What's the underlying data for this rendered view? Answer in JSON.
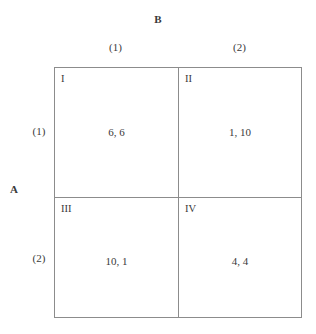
{
  "figure": {
    "type": "payoff-matrix",
    "row_player": "A",
    "column_player": "B",
    "row_strategies": [
      "(1)",
      "(2)"
    ],
    "column_strategies": [
      "(1)",
      "(2)"
    ],
    "border_color": "#8c8c8c",
    "text_color": "#3a3a3a",
    "background": "#ffffff"
  },
  "cells": [
    {
      "id": "I",
      "payoff": "6, 6",
      "row": "(1)",
      "col": "(1)",
      "row_payoff": 6,
      "col_payoff": 6
    },
    {
      "id": "II",
      "payoff": "1, 10",
      "row": "(1)",
      "col": "(2)",
      "row_payoff": 1,
      "col_payoff": 10
    },
    {
      "id": "III",
      "payoff": "10, 1",
      "row": "(2)",
      "col": "(1)",
      "row_payoff": 10,
      "col_payoff": 1
    },
    {
      "id": "IV",
      "payoff": "4, 4",
      "row": "(2)",
      "col": "(2)",
      "row_payoff": 4,
      "col_payoff": 4
    }
  ],
  "chart_data": {
    "type": "table",
    "title": "",
    "xlabel": "B",
    "ylabel": "A",
    "columns": [
      "(1)",
      "(2)"
    ],
    "rows": [
      "(1)",
      "(2)"
    ],
    "cell_labels": [
      [
        "I",
        "II"
      ],
      [
        "III",
        "IV"
      ]
    ],
    "values": [
      [
        "6, 6",
        "1, 10"
      ],
      [
        "10, 1",
        "4, 4"
      ]
    ],
    "series": [
      {
        "name": "A payoff",
        "values": [
          [
            6,
            1
          ],
          [
            10,
            4
          ]
        ]
      },
      {
        "name": "B payoff",
        "values": [
          [
            6,
            10
          ],
          [
            1,
            4
          ]
        ]
      }
    ],
    "grid": true,
    "legend": "none"
  }
}
